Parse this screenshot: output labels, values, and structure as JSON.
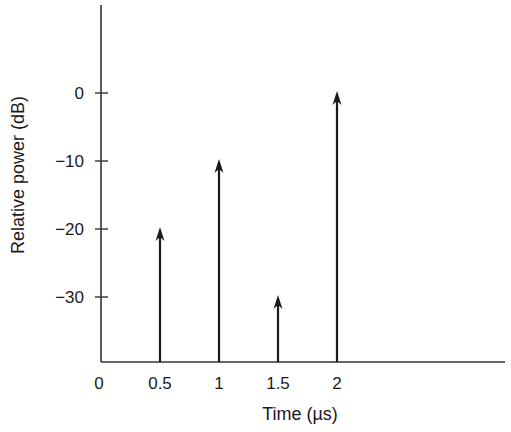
{
  "chart_data": {
    "type": "stem",
    "title": "",
    "xlabel": "Time (µs)",
    "ylabel": "Relative power (dB)",
    "x": [
      0.5,
      1,
      1.5,
      2
    ],
    "values": [
      -20,
      -10,
      -30,
      0
    ],
    "xticks": [
      "0",
      "0.5",
      "1",
      "1.5",
      "2"
    ],
    "yticks": [
      "0",
      "−10",
      "−20",
      "−30"
    ],
    "xlim": [
      0,
      3.45
    ],
    "ylim": [
      -40,
      12
    ],
    "grid": false,
    "legend": null,
    "marker": "arrow"
  },
  "colors": {
    "axis": "#333333",
    "stem": "#1a1a1a",
    "background": "#ffffff"
  }
}
